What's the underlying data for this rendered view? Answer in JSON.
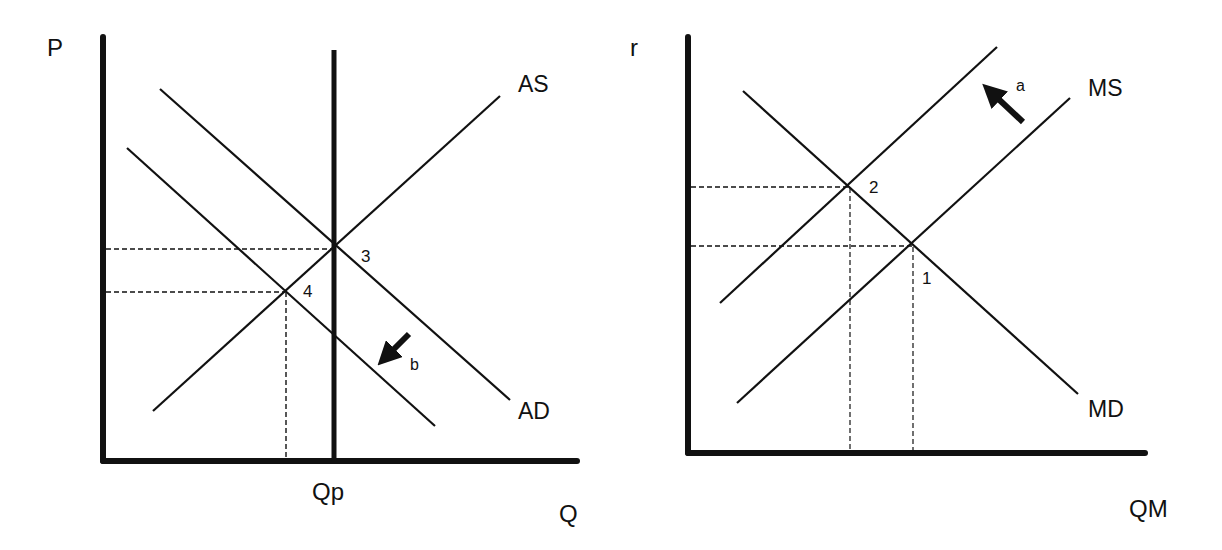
{
  "colors": {
    "ink": "#111111",
    "background": "#ffffff"
  },
  "left_panel": {
    "title": "AD-AS model",
    "y_axis_label": "P",
    "x_axis_label": "Q",
    "potential_output_label": "Qp",
    "curves": {
      "as": "AS",
      "ad": "AD"
    },
    "points": {
      "p3": "3",
      "p4": "4"
    },
    "shift_arrow": {
      "label": "b",
      "direction": "down-left"
    }
  },
  "right_panel": {
    "title": "Money market",
    "y_axis_label": "r",
    "x_axis_label": "QM",
    "curves": {
      "ms": "MS",
      "md": "MD"
    },
    "points": {
      "p1": "1",
      "p2": "2"
    },
    "shift_arrow": {
      "label": "a",
      "direction": "up-left"
    }
  }
}
